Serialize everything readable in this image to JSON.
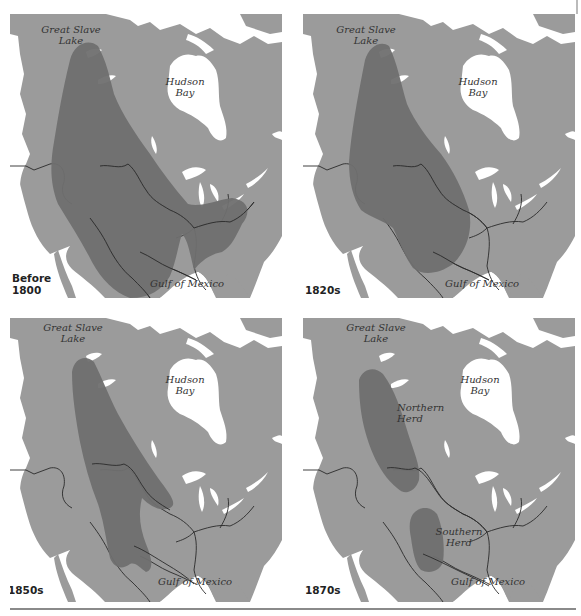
{
  "figure": {
    "colors": {
      "land": "#9b9b9b",
      "range": "#6f6f6f",
      "water": "#ffffff",
      "rivers": "#2a2a2a",
      "background": "#ffffff"
    },
    "panels": [
      {
        "id": "before-1800",
        "era_label_line1": "Before",
        "era_label_line2": "1800",
        "labels": {
          "great_slave_lake_1": "Great Slave",
          "great_slave_lake_2": "Lake",
          "hudson_bay_1": "Hudson",
          "hudson_bay_2": "Bay",
          "gulf": "Gulf of Mexico"
        }
      },
      {
        "id": "1820s",
        "era_label_line1": "1820s",
        "labels": {
          "great_slave_lake_1": "Great Slave",
          "great_slave_lake_2": "Lake",
          "hudson_bay_1": "Hudson",
          "hudson_bay_2": "Bay",
          "gulf": "Gulf of Mexico"
        }
      },
      {
        "id": "1850s",
        "era_label_line1": "1850s",
        "labels": {
          "great_slave_lake_1": "Great Slave",
          "great_slave_lake_2": "Lake",
          "hudson_bay_1": "Hudson",
          "hudson_bay_2": "Bay",
          "gulf": "Gulf of Mexico"
        }
      },
      {
        "id": "1870s",
        "era_label_line1": "1870s",
        "labels": {
          "great_slave_lake_1": "Great Slave",
          "great_slave_lake_2": "Lake",
          "hudson_bay_1": "Hudson",
          "hudson_bay_2": "Bay",
          "gulf": "Gulf of Mexico",
          "northern_herd_1": "Northern",
          "northern_herd_2": "Herd",
          "southern_herd_1": "Southern",
          "southern_herd_2": "Herd"
        }
      }
    ]
  }
}
